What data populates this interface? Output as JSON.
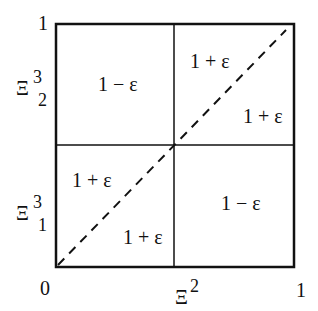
{
  "diagram": {
    "type": "partitioned unit square",
    "axes": {
      "x": {
        "label": "Ξ",
        "label_superscript": "2",
        "ticks": [
          "0",
          "1"
        ]
      },
      "y": {
        "top_tick": "1",
        "regions": [
          {
            "label": "Ξ",
            "superscript": "3",
            "subscript": "2"
          },
          {
            "label": "Ξ",
            "superscript": "3",
            "subscript": "1"
          }
        ]
      }
    },
    "cells": {
      "top_left": "1 − ε",
      "top_right_upper": "1 + ε",
      "top_right_lower": "1 + ε",
      "bottom_left_upper": "1 + ε",
      "bottom_left_lower": "1 + ε",
      "bottom_right": "1 − ε"
    },
    "diagonal": "dashed line from (0,0) to (1,1)",
    "colors": {
      "line": "#111111",
      "background": "#ffffff"
    }
  }
}
